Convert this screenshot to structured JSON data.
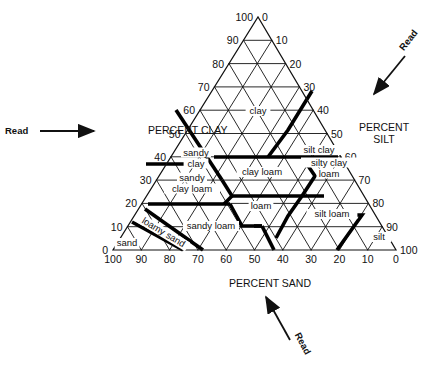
{
  "diagram": {
    "type": "soil-texture-triangle",
    "triangle": {
      "left": [
        113,
        250
      ],
      "right": [
        396,
        250
      ],
      "apex": [
        258,
        17
      ]
    },
    "axes": {
      "clay": {
        "title": "PERCENT CLAY",
        "title_pos": [
          148,
          134
        ],
        "ticks": [
          "0",
          "10",
          "20",
          "30",
          "40",
          "50",
          "60",
          "70",
          "80",
          "90",
          "100"
        ]
      },
      "silt": {
        "title_lines": [
          "PERCENT",
          "SILT"
        ],
        "title_pos": [
          384,
          131
        ],
        "ticks": [
          "0",
          "10",
          "20",
          "30",
          "40",
          "50",
          "60",
          "70",
          "80",
          "90",
          "100"
        ]
      },
      "sand": {
        "title": "PERCENT SAND",
        "title_pos": [
          270,
          287
        ],
        "ticks": [
          "100",
          "90",
          "80",
          "70",
          "60",
          "50",
          "40",
          "30",
          "20",
          "10",
          "0"
        ]
      }
    },
    "read_arrows": [
      {
        "id": "clay",
        "label": "Read",
        "label_pos": [
          5,
          134
        ],
        "from": [
          40,
          131
        ],
        "to": [
          94,
          131
        ]
      },
      {
        "id": "silt",
        "label": "Read",
        "label_pos": [
          411,
          42
        ],
        "from": [
          405,
          56
        ],
        "to": [
          374,
          94
        ]
      },
      {
        "id": "sand",
        "label": "Read",
        "label_pos": [
          300,
          345
        ],
        "from": [
          290,
          340
        ],
        "to": [
          266,
          297
        ]
      }
    ],
    "regions": [
      {
        "name": "clay",
        "label": [
          "clay"
        ],
        "pos": [
          258,
          114
        ]
      },
      {
        "name": "sandy-clay",
        "label": [
          "sandy",
          "clay"
        ],
        "pos": [
          196,
          161
        ]
      },
      {
        "name": "silt-clay",
        "label": [
          "silt clay"
        ],
        "pos": [
          319,
          153
        ]
      },
      {
        "name": "clay-loam",
        "label": [
          "clay loam"
        ],
        "pos": [
          262,
          175
        ]
      },
      {
        "name": "silty-clay-loam",
        "label": [
          "silty clay",
          "loam"
        ],
        "pos": [
          329,
          171
        ]
      },
      {
        "name": "sandy-clay-loam",
        "label": [
          "sandy",
          "clay  loam"
        ],
        "pos": [
          192,
          186
        ]
      },
      {
        "name": "loam",
        "label": [
          "loam"
        ],
        "pos": [
          261,
          209
        ]
      },
      {
        "name": "silt-loam",
        "label": [
          "silt loam"
        ],
        "pos": [
          332,
          217
        ]
      },
      {
        "name": "sandy-loam",
        "label": [
          "sandy loam"
        ],
        "pos": [
          211,
          229
        ]
      },
      {
        "name": "loamy-sand",
        "label": [
          "loamy sand"
        ],
        "pos": [
          162,
          235
        ],
        "rotate": 31
      },
      {
        "name": "sand",
        "label": [
          "sand"
        ],
        "pos": [
          127,
          246
        ]
      },
      {
        "name": "silt",
        "label": [
          "silt"
        ],
        "pos": [
          379,
          240
        ]
      }
    ],
    "boundaries": [
      [
        [
          55,
          45
        ],
        [
          40,
          45
        ],
        [
          35,
          65
        ],
        [
          35,
          45
        ],
        [
          20,
          45
        ]
      ],
      [
        [
          40,
          45
        ],
        [
          40,
          20
        ],
        [
          40,
          0
        ],
        [
          60,
          0
        ]
      ],
      [
        [
          27,
          20
        ],
        [
          27,
          45
        ],
        [
          20,
          52.5
        ]
      ],
      [
        [
          40,
          20
        ],
        [
          27,
          20
        ]
      ],
      [
        [
          27,
          45
        ],
        [
          27,
          22.5
        ],
        [
          40,
          20
        ]
      ],
      [
        [
          20,
          52.5
        ],
        [
          7,
          52.5
        ],
        [
          7,
          43
        ],
        [
          27,
          23
        ]
      ],
      [
        [
          27,
          23
        ],
        [
          27,
          45
        ]
      ],
      [
        [
          20,
          45
        ],
        [
          20,
          80
        ],
        [
          0,
          85
        ]
      ],
      [
        [
          15,
          85
        ],
        [
          0,
          90
        ]
      ],
      [
        [
          10,
          90
        ],
        [
          0,
          70
        ]
      ],
      [
        [
          27,
          20
        ],
        [
          28,
          0
        ]
      ],
      [
        [
          28,
          20
        ],
        [
          40,
          20
        ]
      ],
      [
        [
          12,
          80
        ],
        [
          12,
          88
        ],
        [
          0,
          88
        ]
      ],
      [
        [
          12,
          88
        ],
        [
          0,
          50
        ]
      ],
      [
        [
          40,
          0
        ],
        [
          60,
          0
        ]
      ],
      [
        [
          27,
          0
        ],
        [
          40,
          0
        ]
      ],
      [
        [
          12,
          0
        ],
        [
          27,
          0
        ]
      ]
    ]
  }
}
